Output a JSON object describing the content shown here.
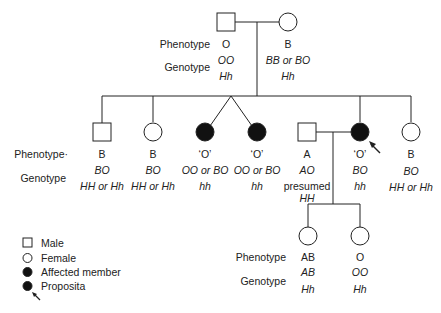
{
  "labels": {
    "phenotype": "Phenotype",
    "phenotype_gen2": "Phenotype·",
    "genotype": "Genotype"
  },
  "generation1": [
    {
      "sex": "male",
      "affected": false,
      "phenotype": "O",
      "genotype_abo": "OO",
      "genotype_h": "Hh"
    },
    {
      "sex": "female",
      "affected": false,
      "phenotype": "B",
      "genotype_abo": "BB or BO",
      "genotype_h": "Hh"
    }
  ],
  "generation2": [
    {
      "sex": "male",
      "affected": false,
      "phenotype": "B",
      "genotype_abo": "BO",
      "genotype_h": "HH or Hh"
    },
    {
      "sex": "female",
      "affected": false,
      "phenotype": "B",
      "genotype_abo": "BO",
      "genotype_h": "HH or Hh"
    },
    {
      "sex": "female",
      "affected": true,
      "twin": true,
      "phenotype": "‘O’",
      "genotype_abo": "OO or BO",
      "genotype_h": "hh"
    },
    {
      "sex": "female",
      "affected": true,
      "twin": true,
      "phenotype": "‘O’",
      "genotype_abo": "OO or BO",
      "genotype_h": "hh"
    },
    {
      "sex": "male",
      "affected": false,
      "spouse": true,
      "phenotype": "A",
      "genotype_abo": "AO",
      "genotype_note": "presumed",
      "genotype_h": "HH"
    },
    {
      "sex": "female",
      "affected": true,
      "proposita": true,
      "phenotype": "‘O’",
      "genotype_abo": "BO",
      "genotype_h": "hh"
    },
    {
      "sex": "female",
      "affected": false,
      "phenotype": "B",
      "genotype_abo": "BO",
      "genotype_h": "HH or Hh"
    }
  ],
  "generation3": [
    {
      "sex": "female",
      "affected": false,
      "phenotype": "AB",
      "genotype_abo": "AB",
      "genotype_h": "Hh"
    },
    {
      "sex": "female",
      "affected": false,
      "phenotype": "O",
      "genotype_abo": "OO",
      "genotype_h": "Hh"
    }
  ],
  "legend": [
    {
      "symbol": "square-icon",
      "label": "Male"
    },
    {
      "symbol": "circle-icon",
      "label": "Female"
    },
    {
      "symbol": "filled-circle-icon",
      "label": "Affected member"
    },
    {
      "symbol": "proposita-arrow-icon",
      "label": "Proposita"
    }
  ],
  "colors": {
    "line": "#222222",
    "fill_affected": "#111111",
    "background": "#ffffff"
  }
}
